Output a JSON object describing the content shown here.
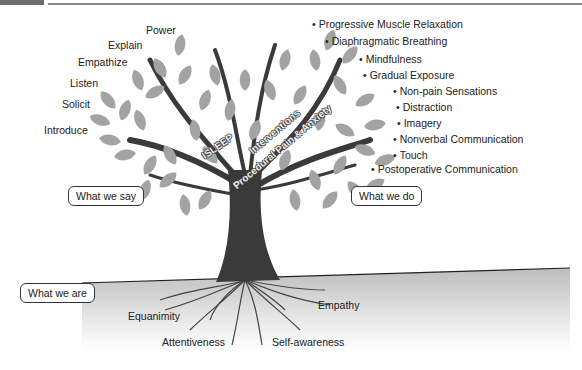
{
  "header": {
    "chapter_text": "CHAPTER"
  },
  "left_labels": [
    "Power",
    "Explain",
    "Empathize",
    "Listen",
    "Solicit",
    "Introduce"
  ],
  "right_labels": [
    "Progressive Muscle Relaxation",
    "Diaphragmatic Breathing",
    "Mindfulness",
    "Gradual Exposure",
    "Non-pain Sensations",
    "Distraction",
    "Imagery",
    "Nonverbal Communication",
    "Touch",
    "Postoperative Communication"
  ],
  "trunk_labels": {
    "isleep": "ISLEEP",
    "interventions": "Interventions",
    "procedural": "Procedural Pain & Anxiety"
  },
  "category_boxes": {
    "say": "What we say",
    "do": "What we do",
    "are": "What we are"
  },
  "root_labels": [
    "Equanimity",
    "Attentiveness",
    "Self-awareness",
    "Empathy"
  ],
  "colors": {
    "leaf": "#a3a3a3",
    "trunk": "#3a3a3a",
    "ground_top": "#c8c8c8"
  }
}
